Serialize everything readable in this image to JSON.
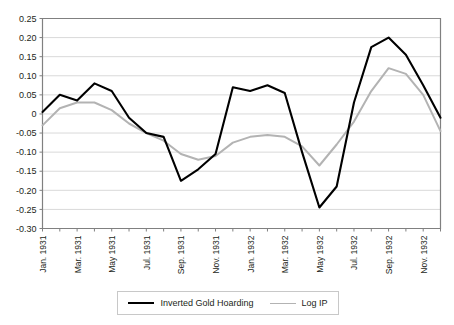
{
  "chart_data": {
    "type": "line",
    "title": "",
    "xlabel": "",
    "ylabel": "",
    "ylim": [
      -0.3,
      0.25
    ],
    "ytick_values": [
      0.25,
      0.2,
      0.15,
      0.1,
      0.05,
      0,
      -0.05,
      -0.1,
      -0.15,
      -0.2,
      -0.25,
      -0.3
    ],
    "ytick_labels": [
      "0.25",
      "0.20",
      "0.15",
      "0.10",
      "0.05",
      "0",
      "-0.05",
      "-0.10",
      "-0.15",
      "-0.20",
      "-0.25",
      "-0.30"
    ],
    "grid": true,
    "legend_position": "bottom",
    "x": [
      "Jan. 1931",
      "Feb. 1931",
      "Mar. 1931",
      "Apr. 1931",
      "May 1931",
      "Jun. 1931",
      "Jul. 1931",
      "Aug. 1931",
      "Sep. 1931",
      "Oct. 1931",
      "Nov. 1931",
      "Dec. 1931",
      "Jan. 1932",
      "Feb. 1932",
      "Mar. 1932",
      "Apr. 1932",
      "May 1932",
      "Jun. 1932",
      "Jul. 1932",
      "Aug. 1932",
      "Sep. 1932",
      "Oct. 1932",
      "Nov. 1932",
      "Dec. 1932"
    ],
    "xtick_labels": [
      "Jan. 1931",
      "Mar. 1931",
      "May 1931",
      "Jul. 1931",
      "Sep. 1931",
      "Nov. 1931",
      "Jan. 1932",
      "Mar. 1932",
      "May 1932",
      "Jul. 1932",
      "Sep. 1932",
      "Nov. 1932"
    ],
    "xtick_indices": [
      0,
      2,
      4,
      6,
      8,
      10,
      12,
      14,
      16,
      18,
      20,
      22
    ],
    "series": [
      {
        "name": "Inverted Gold Hoarding",
        "color": "#000000",
        "width": 2.1,
        "values": [
          0.005,
          0.05,
          0.035,
          0.08,
          0.06,
          -0.01,
          -0.05,
          -0.06,
          -0.175,
          -0.145,
          -0.105,
          0.07,
          0.06,
          0.075,
          0.055,
          -0.1,
          -0.245,
          -0.19,
          0.03,
          0.175,
          0.2,
          0.155,
          0.075,
          -0.01
        ]
      },
      {
        "name": "Log IP",
        "color": "#b3b3b3",
        "width": 2.0,
        "values": [
          -0.03,
          0.015,
          0.03,
          0.03,
          0.01,
          -0.025,
          -0.05,
          -0.07,
          -0.105,
          -0.12,
          -0.11,
          -0.075,
          -0.06,
          -0.055,
          -0.06,
          -0.085,
          -0.135,
          -0.08,
          -0.02,
          0.06,
          0.12,
          0.105,
          0.05,
          -0.045
        ]
      }
    ]
  },
  "legend": {
    "items": [
      {
        "label": "Inverted Gold Hoarding",
        "style": "black"
      },
      {
        "label": "Log IP",
        "style": "gray"
      }
    ]
  }
}
